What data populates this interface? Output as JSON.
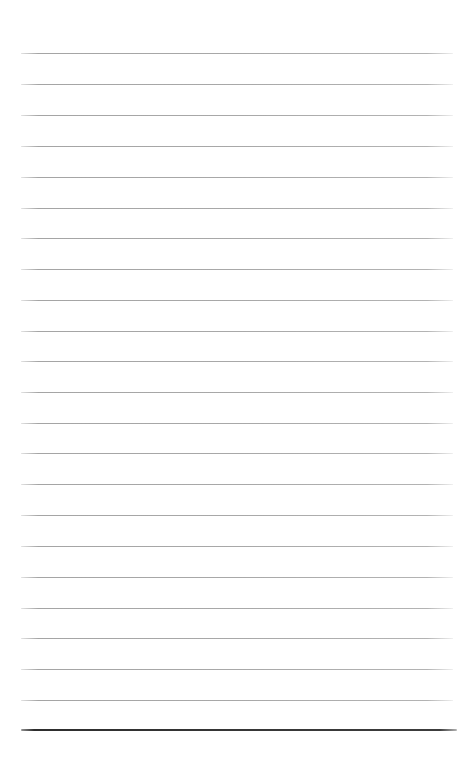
{
  "page": {
    "kind": "blank-lined-notebook-page",
    "background_color": "#ffffff",
    "width": 476,
    "height": 762,
    "ruled_lines": {
      "count": 22,
      "y_positions": [
        53,
        84,
        115,
        146,
        177,
        208,
        238,
        269,
        300,
        331,
        361,
        392,
        423,
        453,
        484,
        515,
        546,
        577,
        608,
        638,
        669,
        700
      ],
      "x_start": 21,
      "x_end": 453,
      "thickness": 1.3,
      "color": "#a8a8a8"
    },
    "footer_rule": {
      "y": 729,
      "x_start": 21,
      "x_end": 457,
      "thickness": 2.4,
      "color": "#373737"
    }
  }
}
